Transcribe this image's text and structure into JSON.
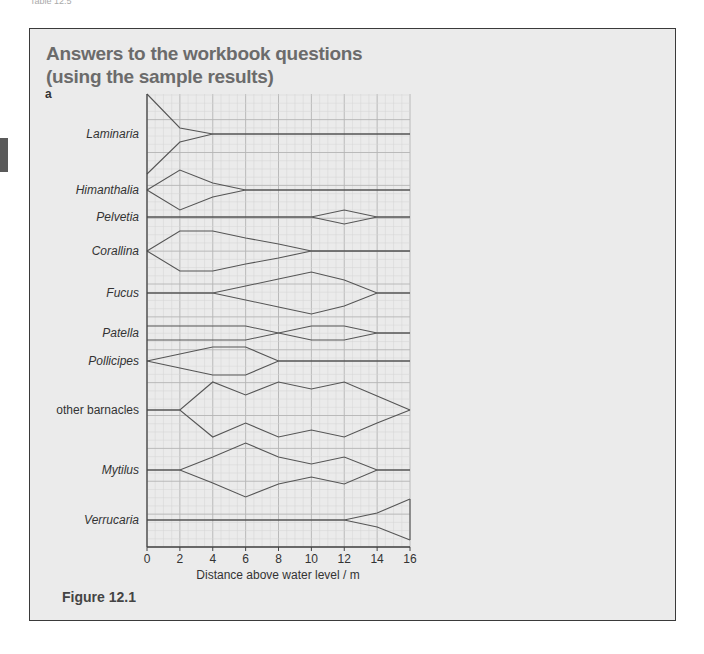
{
  "page": {
    "header_text": "Table 12.5",
    "title_line1": "Answers to the workbook questions",
    "title_line2": "(using the sample results)",
    "part_label": "a",
    "figure_caption": "Figure 12.1"
  },
  "chart_data": {
    "type": "kite",
    "title": "",
    "xlabel": "Distance above water level / m",
    "ylabel": "",
    "xlim": [
      0,
      16
    ],
    "x_ticks": [
      0,
      2,
      4,
      6,
      8,
      10,
      12,
      14,
      16
    ],
    "grid": true,
    "legend": null,
    "series": [
      {
        "name": "Laminaria",
        "italic": true,
        "x": [
          0,
          2,
          4,
          6,
          8,
          10,
          12,
          14,
          16
        ],
        "upper_px_offset": [
          40,
          6,
          0,
          0,
          0,
          0,
          0,
          0,
          0
        ],
        "lower_px_offset": [
          40,
          8,
          0,
          0,
          0,
          0,
          0,
          0,
          0
        ]
      },
      {
        "name": "Himanthalia",
        "italic": true,
        "x": [
          0,
          2,
          4,
          6,
          8,
          10,
          12,
          14,
          16
        ],
        "upper_px_offset": [
          0,
          20,
          7,
          0,
          0,
          0,
          0,
          0,
          0
        ],
        "lower_px_offset": [
          0,
          20,
          7,
          0,
          0,
          0,
          0,
          0,
          0
        ]
      },
      {
        "name": "Pelvetia",
        "italic": true,
        "x": [
          0,
          2,
          4,
          6,
          8,
          10,
          12,
          14,
          16
        ],
        "upper_px_offset": [
          0,
          0,
          0,
          0,
          0,
          0,
          7,
          0,
          0
        ],
        "lower_px_offset": [
          0,
          0,
          0,
          0,
          0,
          0,
          7,
          0,
          0
        ]
      },
      {
        "name": "Corallina",
        "italic": true,
        "x": [
          0,
          2,
          4,
          6,
          8,
          10,
          12,
          14,
          16
        ],
        "upper_px_offset": [
          0,
          20,
          20,
          13,
          7,
          0,
          0,
          0,
          0
        ],
        "lower_px_offset": [
          0,
          20,
          20,
          13,
          7,
          0,
          0,
          0,
          0
        ]
      },
      {
        "name": "Fucus",
        "italic": true,
        "x": [
          0,
          2,
          4,
          6,
          8,
          10,
          12,
          14,
          16
        ],
        "upper_px_offset": [
          0,
          0,
          0,
          7,
          14,
          21,
          13,
          0,
          0
        ],
        "lower_px_offset": [
          0,
          0,
          0,
          7,
          14,
          21,
          13,
          0,
          0
        ]
      },
      {
        "name": "Patella",
        "italic": true,
        "x": [
          0,
          2,
          4,
          6,
          8,
          10,
          12,
          14,
          16
        ],
        "upper_px_offset": [
          7,
          7,
          7,
          7,
          0,
          7,
          7,
          0,
          0
        ],
        "lower_px_offset": [
          7,
          7,
          7,
          7,
          0,
          7,
          7,
          0,
          0
        ],
        "crossing": true
      },
      {
        "name": "Pollicipes",
        "italic": true,
        "x": [
          0,
          2,
          4,
          6,
          8,
          10,
          12,
          14,
          16
        ],
        "upper_px_offset": [
          0,
          7,
          14,
          14,
          0,
          0,
          0,
          0,
          0
        ],
        "lower_px_offset": [
          0,
          7,
          14,
          14,
          0,
          0,
          0,
          0,
          0
        ]
      },
      {
        "name": "other barnacles",
        "italic": false,
        "x": [
          0,
          2,
          4,
          6,
          8,
          10,
          12,
          14,
          16
        ],
        "upper_px_offset": [
          0,
          0,
          28,
          15,
          28,
          21,
          28,
          14,
          0
        ],
        "lower_px_offset": [
          0,
          0,
          27,
          13,
          27,
          20,
          27,
          13,
          0
        ]
      },
      {
        "name": "Mytilus",
        "italic": true,
        "x": [
          0,
          2,
          4,
          6,
          8,
          10,
          12,
          14,
          16
        ],
        "upper_px_offset": [
          0,
          0,
          13,
          27,
          13,
          6,
          13,
          0,
          0
        ],
        "lower_px_offset": [
          0,
          0,
          13,
          27,
          14,
          7,
          14,
          0,
          0
        ]
      },
      {
        "name": "Verrucaria",
        "italic": true,
        "x": [
          0,
          2,
          4,
          6,
          8,
          10,
          12,
          14,
          16
        ],
        "upper_px_offset": [
          0,
          0,
          0,
          0,
          0,
          0,
          0,
          7,
          21
        ],
        "lower_px_offset": [
          0,
          0,
          0,
          0,
          0,
          0,
          0,
          7,
          20
        ]
      }
    ]
  },
  "colors": {
    "panel_bg": "#ebebeb",
    "panel_border": "#3a3a3a",
    "title": "#6b6b6b",
    "grid_major": "#b4b4b4",
    "grid_minor": "#d4d4d4",
    "line": "#555555",
    "axis": "#444444"
  }
}
